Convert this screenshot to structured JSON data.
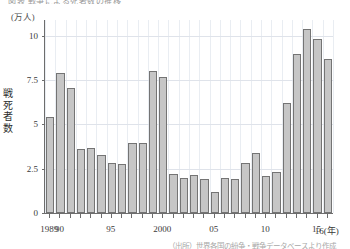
{
  "figure": {
    "title_partial": "図表  戦争による死者数の推移",
    "source_note": "（出所）世界各国の紛争・戦争データベースより作成"
  },
  "axes": {
    "unit_label": "(万人)",
    "y_title": "戦死者数",
    "y_ticks": [
      "0",
      "2.5",
      "5",
      "7.5",
      "10"
    ],
    "y_tick_values": [
      0,
      2.5,
      5,
      7.5,
      10
    ],
    "x_labels": [
      {
        "text": "1989",
        "year": 1989
      },
      {
        "text": "90",
        "year": 1990
      },
      {
        "text": "95",
        "year": 1995
      },
      {
        "text": "2000",
        "year": 2000
      },
      {
        "text": "05",
        "year": 2005
      },
      {
        "text": "10",
        "year": 2010
      },
      {
        "text": "15",
        "year": 2015
      },
      {
        "text": "16(年)",
        "year": 2016
      }
    ]
  },
  "colors": {
    "bar_fill": "#c6c6c6",
    "bar_stroke": "#747474",
    "axis": "#6d6d6d",
    "gridline_h": "#dfe3ea",
    "gridline_v": "#e9edf2",
    "text": "#3a3a3a"
  },
  "chart_data": {
    "type": "bar",
    "title": "図表  戦争による死者数の推移",
    "xlabel": "年",
    "ylabel": "戦死者数",
    "yunit": "万人",
    "ylim": [
      0,
      10.9
    ],
    "yticks": [
      0,
      2.5,
      5,
      7.5,
      10
    ],
    "grid": true,
    "legend": "none",
    "categories": [
      "1989",
      "1990",
      "1991",
      "1992",
      "1993",
      "1994",
      "1995",
      "1996",
      "1997",
      "1998",
      "1999",
      "2000",
      "2001",
      "2002",
      "2003",
      "2004",
      "2005",
      "2006",
      "2007",
      "2008",
      "2009",
      "2010",
      "2011",
      "2012",
      "2013",
      "2014",
      "2015",
      "2016"
    ],
    "values": [
      5.4,
      7.9,
      7.05,
      3.6,
      3.65,
      3.3,
      2.8,
      2.75,
      3.95,
      3.95,
      8.0,
      7.7,
      2.2,
      1.95,
      2.15,
      1.9,
      1.2,
      1.95,
      1.9,
      2.85,
      3.4,
      2.1,
      2.3,
      6.2,
      9.0,
      10.4,
      9.85,
      8.7
    ]
  }
}
